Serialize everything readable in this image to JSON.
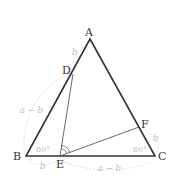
{
  "figure": {
    "type": "geometry-diagram",
    "vertices": {
      "A": {
        "label": "A",
        "x": 90,
        "y": 39
      },
      "B": {
        "label": "B",
        "x": 26,
        "y": 156
      },
      "C": {
        "label": "C",
        "x": 155,
        "y": 156
      },
      "D": {
        "label": "D",
        "x": 73,
        "y": 74
      },
      "E": {
        "label": "E",
        "x": 60,
        "y": 156
      },
      "F": {
        "label": "F",
        "x": 139,
        "y": 127
      }
    },
    "segments": [
      "AB",
      "BC",
      "CA",
      "DE",
      "EF"
    ],
    "angle_labels": {
      "B": "60°",
      "C": "60°"
    },
    "length_labels": {
      "AD": "b",
      "DB": "a − b",
      "BE": "b",
      "EC": "a − b",
      "CF": "b"
    },
    "angle_mark_at": "E",
    "colors": {
      "triangle": "#333333",
      "inner_lines": "#444444",
      "annotation": "#bdbdbd",
      "dashed_arcs": "#d4d4d4"
    }
  }
}
